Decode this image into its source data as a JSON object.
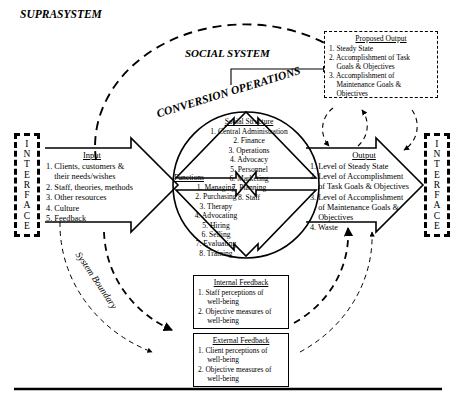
{
  "figure": {
    "suprasystem_label": "SUPRASYSTEM",
    "social_system_label": "SOCIAL SYSTEM",
    "conversion_operations_label": "CONVERSION OPERATIONS",
    "system_boundary_label": "System Boundary",
    "interface_label": "INTERFACE"
  },
  "input": {
    "title": "Input",
    "items": [
      "1. Clients, customers &",
      "    their needs/wishes",
      "2. Staff, theories, methods",
      "3. Other resources",
      "4. Culture",
      "5. Feedback"
    ]
  },
  "social_structure": {
    "title": "Social Structure",
    "items": [
      "1. Central Administration",
      "2. Finance",
      "3. Operations",
      "4. Advocacy",
      "5. Personnel",
      "6. Marketing",
      "7. Planning",
      "8. Staff"
    ]
  },
  "functions": {
    "title": "Functions",
    "items": [
      "1. Managing",
      "2. Purchasing",
      "3. Therapy",
      "4. Advocating",
      "5. Hiring",
      "6. Selling",
      "7. Evaluating",
      "8. Training"
    ]
  },
  "output": {
    "title": "Output",
    "items": [
      "1. Level of Steady State",
      "2. Level of Accomplishment",
      "    of Task Goals & Objectives",
      "3. Level of Accomplishment",
      "    of Maintenance Goals &",
      "    Objectives",
      "4. Waste"
    ]
  },
  "proposed_output": {
    "title": "Proposed Output",
    "items": [
      "1. Steady State",
      "2. Accomplishment of Task",
      "    Goals & Objectives",
      "3. Accomplishment of",
      "    Maintenance Goals &",
      "    Objectives"
    ]
  },
  "internal_feedback": {
    "title": "Internal Feedback",
    "items": [
      "1. Staff perceptions of",
      "     well-being",
      "2. Objective measures of",
      "     well-being"
    ]
  },
  "external_feedback": {
    "title": "External Feedback",
    "items": [
      "1. Client perceptions of",
      "     well-being",
      "2. Objective measures of",
      "     well-being"
    ]
  }
}
